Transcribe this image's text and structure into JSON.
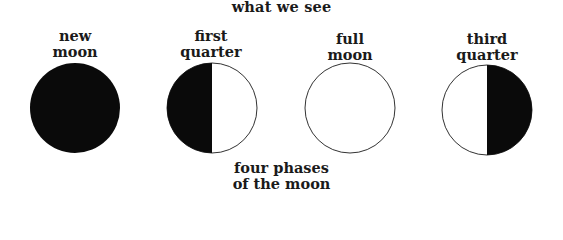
{
  "title": "what we see",
  "phases": [
    {
      "line1": "new",
      "line2": "moon",
      "fill": "new",
      "cx": 75,
      "cy": 108
    },
    {
      "line1": "first",
      "line2": "quarter",
      "fill": "left-dark",
      "cx": 212,
      "cy": 108
    },
    {
      "line1": "full",
      "line2": "moon",
      "fill": "none",
      "cx": 350,
      "cy": 108
    },
    {
      "line1": "third",
      "line2": "quarter",
      "fill": "right-dark",
      "cx": 487,
      "cy": 110
    }
  ],
  "caption": {
    "line1": "four phases",
    "line2": "of the moon"
  },
  "colors": {
    "dark": "#0a0a0a",
    "light": "#ffffff",
    "outline": "#333333"
  }
}
